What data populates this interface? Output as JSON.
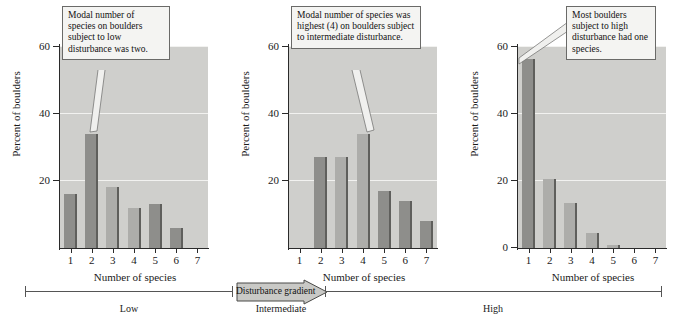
{
  "figure": {
    "caption": "",
    "y_axis_title": "Percent of boulders",
    "x_axis_title": "Number of species",
    "y_ticks": [
      20,
      40,
      60
    ],
    "y_tick_labels_left": [
      "60",
      "40",
      "20"
    ],
    "y_tick_labels_right": [
      "60",
      "40",
      "20",
      "0"
    ],
    "x_tick_labels": [
      "1",
      "2",
      "3",
      "4",
      "5",
      "6",
      "7"
    ],
    "colors": {
      "plot_background": "#cfcfcc",
      "gridline": "#f2f2f0",
      "bar_light": "#adadaa",
      "bar_dark": "#8e8e8b",
      "bar_edge": "#5f5f5c",
      "axis": "#2a2a2a",
      "callout_fill": "#f4f4f2",
      "callout_border": "#6a6a68"
    }
  },
  "chart_data": [
    {
      "type": "bar",
      "title": "Low disturbance",
      "panel": "left",
      "categories": [
        "1",
        "2",
        "3",
        "4",
        "5",
        "6",
        "7"
      ],
      "values": [
        16,
        34,
        18,
        12,
        13,
        6,
        0
      ],
      "shades": [
        "dark",
        "dark",
        "light",
        "light",
        "dark",
        "dark",
        "light"
      ],
      "xlabel": "Number of species",
      "ylabel": "Percent of boulders",
      "ylim": [
        0,
        60
      ],
      "yticks": [
        20,
        40,
        60
      ],
      "grid": true,
      "legend": "none",
      "annotation": "Modal number of species on boulders subject to low disturbance was two."
    },
    {
      "type": "bar",
      "title": "Intermediate disturbance",
      "panel": "middle",
      "categories": [
        "1",
        "2",
        "3",
        "4",
        "5",
        "6",
        "7"
      ],
      "values": [
        0,
        27,
        27,
        34,
        17,
        14,
        8
      ],
      "shades": [
        "light",
        "dark",
        "light",
        "light",
        "dark",
        "dark",
        "dark"
      ],
      "xlabel": "Number of species",
      "ylabel": "Percent of boulders",
      "ylim": [
        0,
        60
      ],
      "yticks": [
        20,
        40,
        60
      ],
      "grid": true,
      "legend": "none",
      "annotation": "Modal number of species was highest (4) on boulders subject to intermediate disturbance."
    },
    {
      "type": "bar",
      "title": "High disturbance",
      "panel": "right",
      "categories": [
        "1",
        "2",
        "3",
        "4",
        "5",
        "6",
        "7"
      ],
      "values": [
        56,
        20.5,
        13.5,
        4.5,
        1,
        0,
        0
      ],
      "shades": [
        "dark",
        "light",
        "light",
        "light",
        "light",
        "light",
        "light"
      ],
      "xlabel": "Number of species",
      "ylabel": "Percent of boulders",
      "ylim": [
        0,
        60
      ],
      "yticks": [
        0,
        20,
        40,
        60
      ],
      "grid": true,
      "legend": "none",
      "annotation": "Most boulders subject to high disturbance had one species."
    }
  ],
  "callouts": [
    {
      "id": "callout-low",
      "text": "Modal number of species on boulders subject to low disturbance was two."
    },
    {
      "id": "callout-intermediate",
      "text": "Modal number of species was highest (4) on boulders subject to intermediate disturbance."
    },
    {
      "id": "callout-high",
      "text": "Most boulders subject to high disturbance had one species."
    }
  ],
  "gradient": {
    "arrow_label": "Disturbance gradient",
    "levels": [
      "Low",
      "Intermediate",
      "High"
    ]
  }
}
